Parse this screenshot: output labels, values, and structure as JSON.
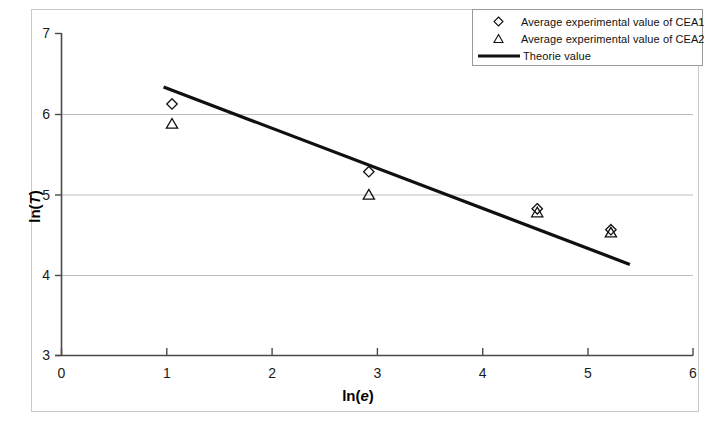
{
  "chart_data": {
    "type": "scatter",
    "title": "",
    "xlabel": "ln(e)",
    "ylabel": "ln(T)",
    "xlim": [
      0,
      6
    ],
    "ylim": [
      3,
      7
    ],
    "xticks": [
      "0",
      "1",
      "2",
      "3",
      "4",
      "5",
      "6"
    ],
    "yticks": [
      "3",
      "4",
      "5",
      "6",
      "7"
    ],
    "grid": "horizontal",
    "legend_position": "top-right",
    "series": [
      {
        "name": "Average experimental value of CEA1",
        "marker": "diamond-open",
        "x": [
          1.05,
          2.92,
          4.52,
          5.22
        ],
        "y": [
          6.12,
          5.28,
          4.82,
          4.56
        ]
      },
      {
        "name": "Average experimental value of CEA2",
        "marker": "triangle-open",
        "x": [
          1.05,
          2.92,
          4.52,
          5.22
        ],
        "y": [
          5.88,
          5.0,
          4.78,
          4.53
        ]
      },
      {
        "name": "Theorie value",
        "marker": "line",
        "x": [
          0.97,
          5.4
        ],
        "y": [
          6.33,
          4.13
        ]
      }
    ]
  },
  "axes": {
    "y_label": "ln(",
    "y_label_italic": "T",
    "y_label_close": ")",
    "x_label": "ln(",
    "x_label_italic": "e",
    "x_label_close": ")",
    "y_ticks": [
      {
        "value": "7"
      },
      {
        "value": "6"
      },
      {
        "value": "5"
      },
      {
        "value": "4"
      },
      {
        "value": "3"
      }
    ],
    "x_ticks": [
      {
        "value": "0"
      },
      {
        "value": "1"
      },
      {
        "value": "2"
      },
      {
        "value": "3"
      },
      {
        "value": "4"
      },
      {
        "value": "5"
      },
      {
        "value": "6"
      }
    ]
  },
  "legend": {
    "entries": [
      {
        "label": "Average experimental value of CEA1",
        "key": "diamond-open-marker"
      },
      {
        "label": "Average experimental value of CEA2",
        "key": "triangle-open-marker"
      },
      {
        "label": "Theorie value",
        "key": "solid-line-swatch"
      }
    ]
  },
  "colors": {
    "axis": "#3a3a3a",
    "grid": "#bdbdbd",
    "series_line": "#101010",
    "frame": "#c9c9c9",
    "background": "#ffffff"
  }
}
